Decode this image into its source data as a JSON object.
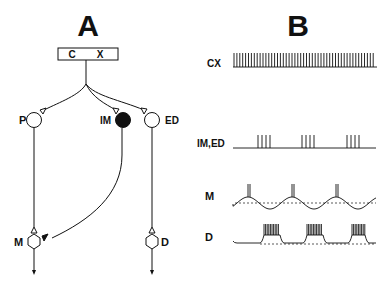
{
  "panel_a": {
    "title": "A",
    "box": {
      "left": "C",
      "right": "X"
    },
    "neurons": {
      "p": "P",
      "im": "IM",
      "ed": "ED",
      "m": "M",
      "d": "D"
    }
  },
  "panel_b": {
    "title": "B",
    "traces": [
      {
        "label": "CX",
        "pattern": "regular tonic spiking"
      },
      {
        "label": "IM,ED",
        "pattern": "periodic bursts of 4 spikes"
      },
      {
        "label": "M",
        "pattern": "oscillating membrane with single spike doublets at peaks"
      },
      {
        "label": "D",
        "pattern": "plateau bursts"
      }
    ]
  },
  "colors": {
    "ink": "#111111",
    "background": "#ffffff"
  }
}
